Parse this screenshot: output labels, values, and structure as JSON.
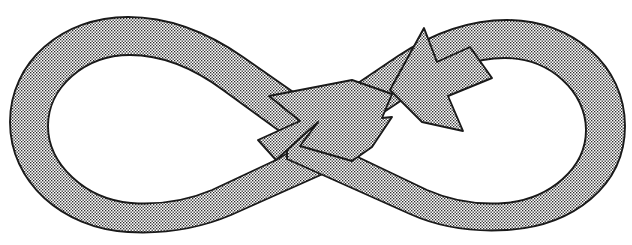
{
  "figure": {
    "name": "infinity-loop-arrow",
    "title": "Figure-eight loop with arrowhead",
    "canvas": {
      "width": 632,
      "height": 245
    },
    "style": {
      "fill_pattern": "halftone-dots",
      "fill_dot_color": "#2b2b2b",
      "background_color": "#ffffff",
      "outline_color": "#1a1a1a",
      "outline_width": 1.9
    },
    "parts": [
      {
        "name": "left-loop",
        "label": "Left loop"
      },
      {
        "name": "right-loop",
        "label": "Right loop"
      },
      {
        "name": "center-crossing",
        "label": "Center crossing"
      },
      {
        "name": "arrowhead",
        "label": "Arrowhead"
      }
    ],
    "geometry": {
      "outer_band_path": "M 392 94 L 424 28 L 437 60 L 470 46 C 520 27 575 45 605 85 C 637 129 627 183 592 211 C 556 240 500 238 462 214 L 282 104 C 249 85 214 80 180 92 C 140 106 116 141 120 177 C 124 214 156 238 193 233 C 224 229 249 208 268 184 L 352 80 Z",
      "inner_band_path": "M 392 117 L 414 71 L 424 95 L 452 82 C 498 61 548 76 574 112 C 601 149 593 192 563 213 C 534 234 489 231 457 210 L 277 100 C 238 76 196 69 157 82 C 112 97 85 137 89 178 C 93 219 129 247 170 241 C 205 236 233 212 253 186 L 352 104 Z",
      "left_loop_outer_bounds": {
        "left": 10,
        "top": 17,
        "right": 300,
        "bottom": 232
      },
      "right_loop_outer_bounds": {
        "left": 330,
        "top": 20,
        "right": 625,
        "bottom": 230
      },
      "crossing_point": {
        "x": 318,
        "y": 122
      },
      "arrow_tip": {
        "x": 390,
        "y": 90
      },
      "arrow_barb_upper": {
        "x": 425,
        "y": 28
      },
      "arrow_barb_lower": {
        "x": 448,
        "y": 96
      },
      "arrow_direction": "up-left",
      "flow_direction": "counter-clockwise"
    }
  }
}
